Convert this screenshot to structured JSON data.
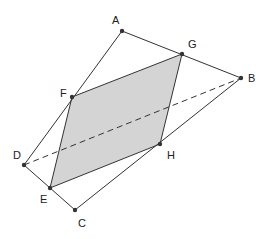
{
  "diagram": {
    "points": {
      "A": {
        "label": "A",
        "x": 122,
        "y": 31,
        "lx": 112,
        "ly": 24
      },
      "G": {
        "label": "G",
        "x": 182,
        "y": 54,
        "lx": 188,
        "ly": 48
      },
      "B": {
        "label": "B",
        "x": 241,
        "y": 78,
        "lx": 248,
        "ly": 82
      },
      "F": {
        "label": "F",
        "x": 72,
        "y": 97,
        "lx": 60,
        "ly": 97
      },
      "D": {
        "label": "D",
        "x": 24,
        "y": 165,
        "lx": 13,
        "ly": 159
      },
      "H": {
        "label": "H",
        "x": 160,
        "y": 144,
        "lx": 167,
        "ly": 159
      },
      "E": {
        "label": "E",
        "x": 50,
        "y": 188,
        "lx": 40,
        "ly": 203
      },
      "C": {
        "label": "C",
        "x": 75,
        "y": 210,
        "lx": 78,
        "ly": 227
      }
    },
    "shaded_color": "#d4d4d4",
    "line_color": "#333333"
  }
}
